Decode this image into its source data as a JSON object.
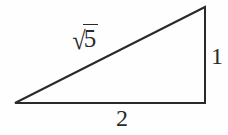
{
  "figure": {
    "kind": "right-triangle-diagram",
    "background_color": "#fefefe",
    "stroke_color": "#2a2a2a",
    "stroke_width": 2,
    "vertices": {
      "left": [
        15,
        103
      ],
      "bottom_right": [
        205,
        103
      ],
      "top_right": [
        205,
        7
      ]
    },
    "labels": {
      "hypotenuse_radical": "√",
      "hypotenuse_radicand": "5",
      "hypotenuse_full": "√5",
      "vertical_leg": "1",
      "horizontal_leg": "2"
    }
  },
  "chart_data": {
    "type": "diagram",
    "title": "",
    "shape": "right triangle",
    "sides": [
      {
        "name": "horizontal leg",
        "label": "2",
        "value": 2,
        "position": "bottom"
      },
      {
        "name": "vertical leg",
        "label": "1",
        "value": 1,
        "position": "right"
      },
      {
        "name": "hypotenuse",
        "label": "√5",
        "value": 2.2360679,
        "position": "upper-left"
      }
    ],
    "right_angle_at": "bottom-right vertex",
    "annotations": [
      "√5",
      "1",
      "2"
    ]
  }
}
